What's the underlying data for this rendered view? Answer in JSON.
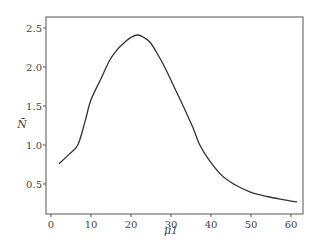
{
  "chart_data": {
    "type": "line",
    "title": "",
    "xlabel": "μ1",
    "ylabel": "N̄",
    "xlim": [
      -1,
      63.5
    ],
    "ylim": [
      0.09,
      2.64
    ],
    "xticks": [
      0,
      10,
      20,
      30,
      40,
      50,
      60
    ],
    "xtick_labels": [
      "0",
      "10",
      "20",
      "30",
      "40",
      "50",
      "60"
    ],
    "yticks": [
      0.5,
      1.0,
      1.5,
      2.0,
      2.5
    ],
    "ytick_labels": [
      "0.5",
      "1.0",
      "1.5",
      "2.0",
      "2.5"
    ],
    "grid": false,
    "legend": null,
    "series": [
      {
        "name": "N̄",
        "color": "#333333",
        "x": [
          2,
          4.5,
          6.7,
          8.5,
          10,
          12.5,
          14.7,
          16.5,
          18.5,
          20,
          21.7,
          23.2,
          24.7,
          26.5,
          28.5,
          31,
          33.5,
          35.5,
          37.2,
          39.5,
          42.7,
          46,
          49.7,
          54,
          58,
          61.5
        ],
        "y": [
          0.76,
          0.88,
          1.0,
          1.3,
          1.58,
          1.85,
          2.09,
          2.22,
          2.32,
          2.38,
          2.41,
          2.38,
          2.32,
          2.18,
          1.99,
          1.72,
          1.45,
          1.22,
          1.0,
          0.81,
          0.61,
          0.49,
          0.4,
          0.34,
          0.3,
          0.27
        ]
      }
    ]
  }
}
